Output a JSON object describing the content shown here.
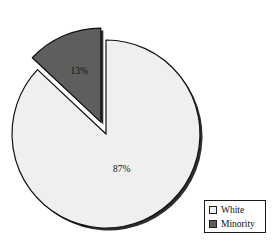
{
  "chart_data": {
    "type": "pie",
    "title": "",
    "subtitle": "",
    "xlabel": "",
    "ylabel": "",
    "grid": false,
    "legend_position": "bottom-right",
    "categories": [
      "White",
      "Minority"
    ],
    "values": [
      87,
      13
    ],
    "unit": "%",
    "data_labels": [
      "87%",
      "13%"
    ],
    "colors": [
      "#efefef",
      "#5e5e5e"
    ],
    "exploded": [
      false,
      true
    ],
    "slices": [
      {
        "name": "White",
        "value": 87,
        "label": "87%",
        "color": "#efefef",
        "exploded": false
      },
      {
        "name": "Minority",
        "value": 13,
        "label": "13%",
        "color": "#5e5e5e",
        "exploded": true
      }
    ]
  },
  "legend": {
    "items": [
      {
        "label": "White",
        "swatch_color": "#efefef"
      },
      {
        "label": "Minority",
        "swatch_color": "#5e5e5e"
      }
    ]
  },
  "labels": {
    "white_pct": "87%",
    "minority_pct": "13%"
  },
  "colors": {
    "background": "#ffffff",
    "outline": "#101010",
    "shadow": "#1c1c1c",
    "white_slice": "#efefef",
    "minority_slice": "#5e5e5e"
  }
}
